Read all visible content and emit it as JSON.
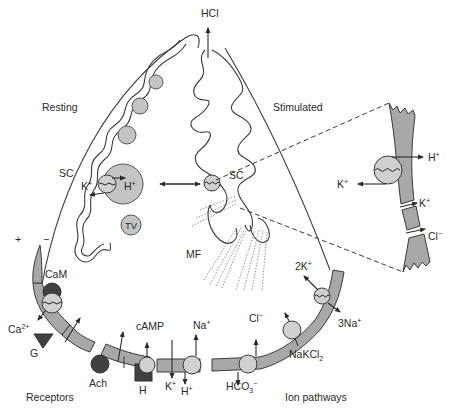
{
  "figure": {
    "state_labels": {
      "resting": "Resting",
      "stimulated": "Stimulated"
    },
    "secretion_product": "HCl",
    "organelles": {
      "secretory_canaliculus_left": "SC",
      "secretory_canaliculus_right": "SC",
      "tubulovesicle": "TV",
      "microfilaments": "MF"
    },
    "pump": {
      "k_ion": "K",
      "k_charge": "+",
      "h_ion": "H",
      "h_charge": "+"
    },
    "membrane_potential": {
      "plus": "+",
      "minus": "−"
    },
    "receptors": {
      "title": "Receptors",
      "calmodulin": "CaM",
      "calcium_ion": "Ca",
      "calcium_charge": "2+",
      "gastrin": "G",
      "acetylcholine": "Ach",
      "histamine": "H",
      "second_messenger": "cAMP"
    },
    "ion_pathways": {
      "title": "Ion pathways",
      "k_out": "K",
      "k_out_charge": "+",
      "na_in": "Na",
      "na_in_charge": "+",
      "h_out": "H",
      "h_out_charge": "+",
      "cl_basal": "Cl",
      "cl_basal_charge": "−",
      "bicarbonate": "HCO",
      "bicarbonate_sub": "3",
      "bicarbonate_charge": "−",
      "cotransporter": "NaKCl",
      "cotransporter_sub": "2",
      "potassium_2": "2K",
      "potassium_2_charge": "+",
      "sodium_3": "3Na",
      "sodium_3_charge": "+"
    },
    "inset": {
      "h_ion": "H",
      "h_charge": "+",
      "k_ion_pump": "K",
      "k_pump_charge": "+",
      "k_channel": "K",
      "k_channel_charge": "+",
      "cl_channel": "Cl",
      "cl_channel_charge": "−"
    },
    "colors": {
      "membrane": "#a8a8a8",
      "channel": "#d0d0d0",
      "vesicle": "#c4c4c4",
      "ligand": "#404040",
      "outline": "#3a3a3a"
    }
  }
}
